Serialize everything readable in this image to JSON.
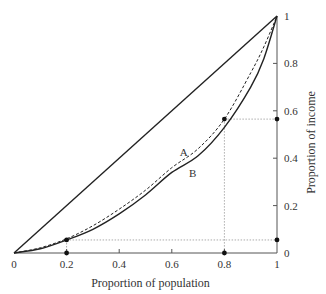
{
  "chart_data": {
    "type": "line",
    "title": "",
    "xlabel": "Proportion of population",
    "ylabel": "Proportion of income",
    "xlim": [
      0,
      1
    ],
    "ylim": [
      0,
      1
    ],
    "x_ticks": [
      "0",
      "0.2",
      "0.4",
      "0.6",
      "0.8",
      "1"
    ],
    "y_ticks": [
      "0",
      "0.2",
      "0.4",
      "0.6",
      "0.8",
      "1"
    ],
    "y_axis_side": "right",
    "grid": false,
    "series": [
      {
        "name": "Line of equality",
        "style": "solid",
        "x": [
          0,
          1
        ],
        "y": [
          0,
          1
        ]
      },
      {
        "name": "A",
        "label": "A",
        "style": "dashed",
        "x": [
          0,
          0.1,
          0.2,
          0.3,
          0.4,
          0.5,
          0.6,
          0.7,
          0.8,
          0.9,
          0.95,
          1
        ],
        "y": [
          0,
          0.022,
          0.06,
          0.115,
          0.185,
          0.265,
          0.36,
          0.44,
          0.565,
          0.76,
          0.87,
          1
        ]
      },
      {
        "name": "B",
        "label": "B",
        "style": "solid",
        "x": [
          0,
          0.1,
          0.2,
          0.3,
          0.4,
          0.5,
          0.6,
          0.7,
          0.8,
          0.9,
          0.95,
          1
        ],
        "y": [
          0,
          0.018,
          0.055,
          0.1,
          0.165,
          0.245,
          0.34,
          0.41,
          0.53,
          0.7,
          0.82,
          1
        ]
      }
    ],
    "annotations": {
      "marked_points": [
        {
          "x": 0.2,
          "y": 0.055
        },
        {
          "x": 0.8,
          "y": 0.565
        }
      ],
      "axis_markers_x": [
        0.2,
        0.8
      ],
      "axis_markers_y": [
        0.055,
        0.565
      ],
      "labels": [
        {
          "text": "A",
          "x": 0.63,
          "y": 0.41
        },
        {
          "text": "B",
          "x": 0.665,
          "y": 0.32
        }
      ]
    }
  }
}
